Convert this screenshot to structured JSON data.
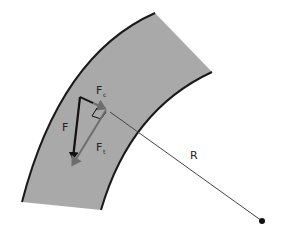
{
  "diagram": {
    "type": "force-on-curved-path",
    "colors": {
      "band_fill": "#a9a9a9",
      "band_edge": "#1a1a1a",
      "force_dark": "#111111",
      "force_gray": "#6e6e6e",
      "radius_line": "#444444"
    },
    "labels": {
      "force": "F",
      "centripetal": "F",
      "centripetal_sub": "c",
      "tangential": "F",
      "tangential_sub": "t",
      "radius": "R"
    }
  }
}
